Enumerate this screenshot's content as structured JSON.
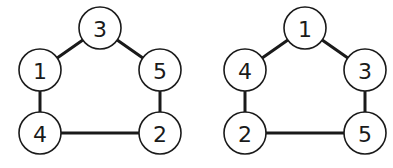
{
  "diagram": {
    "type": "graph-pair",
    "colors": {
      "stroke": "#1a1a1a",
      "node_fill": "#ffffff",
      "background": "#ffffff"
    },
    "node_radius": 21,
    "graphs": [
      {
        "id": "left",
        "nodes": [
          {
            "label": "3",
            "x": 100,
            "y": 28
          },
          {
            "label": "1",
            "x": 40,
            "y": 70
          },
          {
            "label": "5",
            "x": 160,
            "y": 70
          },
          {
            "label": "4",
            "x": 40,
            "y": 133
          },
          {
            "label": "2",
            "x": 160,
            "y": 133
          }
        ],
        "edges": [
          [
            "3",
            "1"
          ],
          [
            "3",
            "5"
          ],
          [
            "1",
            "4"
          ],
          [
            "5",
            "2"
          ],
          [
            "4",
            "2"
          ]
        ]
      },
      {
        "id": "right",
        "nodes": [
          {
            "label": "1",
            "x": 305,
            "y": 28
          },
          {
            "label": "4",
            "x": 245,
            "y": 70
          },
          {
            "label": "3",
            "x": 365,
            "y": 70
          },
          {
            "label": "2",
            "x": 245,
            "y": 133
          },
          {
            "label": "5",
            "x": 365,
            "y": 133
          }
        ],
        "edges": [
          [
            "1",
            "4"
          ],
          [
            "1",
            "3"
          ],
          [
            "4",
            "2"
          ],
          [
            "3",
            "5"
          ],
          [
            "2",
            "5"
          ]
        ]
      }
    ]
  }
}
